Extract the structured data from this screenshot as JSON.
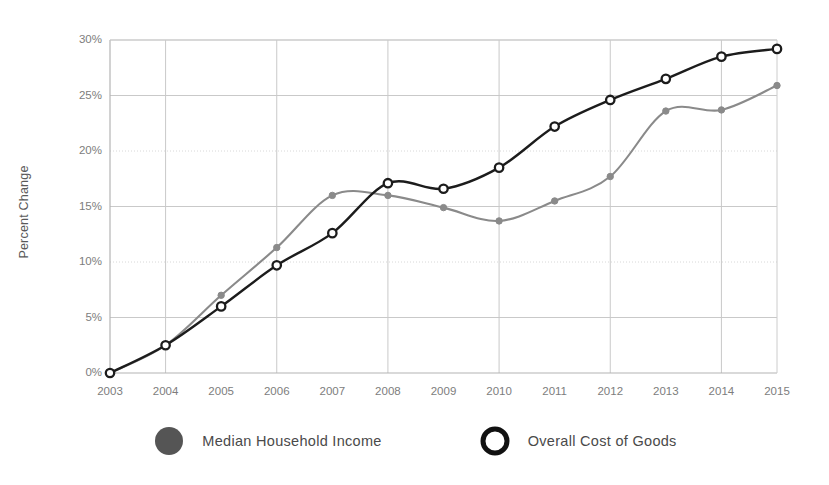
{
  "chart_data": {
    "type": "line",
    "title": "",
    "xlabel": "",
    "ylabel": "Percent Change",
    "x": [
      2003,
      2004,
      2005,
      2006,
      2007,
      2008,
      2009,
      2010,
      2011,
      2012,
      2013,
      2014,
      2015
    ],
    "categories": [
      "2003",
      "2004",
      "2005",
      "2006",
      "2007",
      "2008",
      "2009",
      "2010",
      "2011",
      "2012",
      "2013",
      "2014",
      "2015"
    ],
    "series": [
      {
        "name": "Median Household Income",
        "color": "#8a8a8a",
        "marker": "filled-circle",
        "values": [
          0.0,
          2.5,
          7.0,
          11.3,
          16.0,
          16.0,
          14.9,
          13.7,
          15.5,
          17.7,
          23.6,
          23.7,
          25.9
        ]
      },
      {
        "name": "Overall Cost of Goods",
        "color": "#1c1c1c",
        "marker": "open-circle",
        "values": [
          0.0,
          2.5,
          6.0,
          9.7,
          12.6,
          17.1,
          16.6,
          18.5,
          22.2,
          24.6,
          26.5,
          28.5,
          29.2
        ]
      }
    ],
    "ylim": [
      0,
      30
    ],
    "xlim": [
      2003,
      2015
    ],
    "yticks": [
      0,
      5,
      10,
      15,
      20,
      25,
      30
    ],
    "ytick_labels": [
      "0%",
      "5%",
      "10%",
      "15%",
      "20%",
      "25%",
      "30%"
    ],
    "xtick_labels": [
      "2003",
      "2004",
      "2005",
      "2006",
      "2007",
      "2008",
      "2009",
      "2010",
      "2011",
      "2012",
      "2013",
      "2014",
      "2015"
    ],
    "gridlines": {
      "horizontal": true,
      "vertical": true,
      "vertical_at": [
        2004,
        2006,
        2008,
        2010,
        2012,
        2014
      ],
      "color": "#c9c9c9"
    },
    "legend": {
      "position": "bottom",
      "entries": [
        {
          "label": "Median Household Income",
          "marker": "filled-circle",
          "color": "#555555"
        },
        {
          "label": "Overall Cost of Goods",
          "marker": "open-circle",
          "color": "#111111"
        }
      ]
    }
  }
}
